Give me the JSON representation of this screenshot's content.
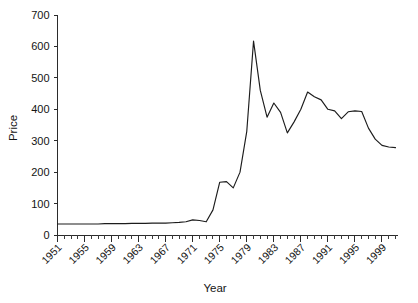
{
  "chart_data": {
    "type": "line",
    "title": "",
    "subtitle": "",
    "xlabel": "Year",
    "ylabel": "Price",
    "xlim": [
      1951,
      2001
    ],
    "ylim": [
      0,
      700
    ],
    "grid": false,
    "legend": false,
    "legend_position": "none",
    "yticks": [
      0,
      100,
      200,
      300,
      400,
      500,
      600,
      700
    ],
    "ytick_labels": [
      "0",
      "100",
      "200",
      "300",
      "400",
      "500",
      "600",
      "700"
    ],
    "xticks": [
      1951,
      1955,
      1959,
      1963,
      1967,
      1971,
      1975,
      1979,
      1983,
      1987,
      1991,
      1995,
      1999
    ],
    "xtick_labels": [
      "1951",
      "1955",
      "1959",
      "1963",
      "1967",
      "1971",
      "1975",
      "1979",
      "1983",
      "1987",
      "1991",
      "1995",
      "1999"
    ],
    "xtick_minor_interval": 1,
    "series_color": "#1c1c1c",
    "x": [
      1951,
      1952,
      1953,
      1954,
      1955,
      1956,
      1957,
      1958,
      1959,
      1960,
      1961,
      1962,
      1963,
      1964,
      1965,
      1966,
      1967,
      1968,
      1969,
      1970,
      1971,
      1972,
      1973,
      1974,
      1975,
      1976,
      1977,
      1978,
      1979,
      1980,
      1981,
      1982,
      1983,
      1984,
      1985,
      1986,
      1987,
      1988,
      1989,
      1990,
      1991,
      1992,
      1993,
      1994,
      1995,
      1996,
      1997,
      1998,
      1999,
      2000,
      2001
    ],
    "values": [
      35,
      35,
      35,
      35,
      35,
      35,
      35,
      36,
      36,
      36,
      36,
      37,
      37,
      37,
      38,
      38,
      38,
      39,
      40,
      42,
      48,
      46,
      42,
      80,
      168,
      170,
      150,
      200,
      330,
      617,
      460,
      375,
      420,
      390,
      325,
      360,
      400,
      455,
      440,
      430,
      400,
      395,
      370,
      392,
      395,
      393,
      340,
      305,
      285,
      280,
      278
    ],
    "annotations": []
  },
  "axes": {
    "ylabel": "Price",
    "xlabel": "Year"
  }
}
